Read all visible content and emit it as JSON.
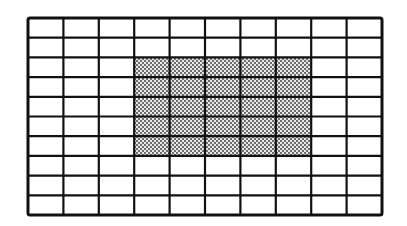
{
  "diagram": {
    "type": "grid",
    "columns": 10,
    "rows": 10,
    "shaded_region": {
      "col_start": 3,
      "col_end": 7,
      "row_start": 2,
      "row_end": 6,
      "pattern": "dot-stipple"
    },
    "colors": {
      "line": "#111111",
      "background": "#ffffff",
      "dot": "#333333"
    }
  }
}
